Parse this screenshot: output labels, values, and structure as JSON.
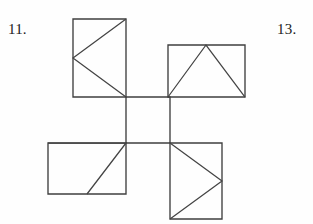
{
  "page": {
    "background_color": "#fefefe",
    "width": 313,
    "height": 224
  },
  "labels": [
    {
      "id": "label-11",
      "text": "11.",
      "x": 8,
      "y": 22
    },
    {
      "id": "label-13",
      "text": "13.",
      "x": 277,
      "y": 22
    }
  ],
  "figure": {
    "name": "cube-net-with-triangles",
    "stroke_color": "#3f3f3f",
    "stroke_width": 1.35,
    "fill": "none",
    "squares": [
      {
        "name": "top-left-square",
        "x1": 73,
        "y1": 19,
        "x2": 126,
        "y2": 97,
        "triangle_direction": "points-left",
        "triangle_points": "126,19 73,58 126,97"
      },
      {
        "name": "top-right-square",
        "x1": 168,
        "y1": 45,
        "x2": 245,
        "y2": 97,
        "triangle_direction": "points-up",
        "triangle_points": "168,97 206,45 245,97"
      },
      {
        "name": "center-square",
        "x1": 126,
        "y1": 97,
        "x2": 170,
        "y2": 143,
        "triangle_direction": "none",
        "triangle_points": ""
      },
      {
        "name": "bottom-left-square",
        "x1": 48,
        "y1": 143,
        "x2": 126,
        "y2": 194,
        "triangle_direction": "points-down",
        "triangle_points": "48,143 126,143 87,194"
      },
      {
        "name": "bottom-right-square",
        "x1": 170,
        "y1": 143,
        "x2": 222,
        "y2": 219,
        "triangle_direction": "points-right",
        "triangle_points": "170,143 222,181 170,219"
      }
    ]
  },
  "chart_data": {
    "type": "diagram",
    "title": "",
    "subtitle": "",
    "shapes": [
      {
        "label": "top-left-square",
        "kind": "square",
        "left": 73,
        "top": 19,
        "right": 126,
        "bottom": 97,
        "width": 53,
        "height": 78,
        "inner": "triangle pointing left, apex at left-edge midpoint"
      },
      {
        "label": "top-right-square",
        "kind": "square",
        "left": 168,
        "top": 45,
        "right": 245,
        "bottom": 97,
        "width": 77,
        "height": 52,
        "inner": "triangle pointing up, apex at top-edge midpoint"
      },
      {
        "label": "center-square",
        "kind": "square",
        "left": 126,
        "top": 97,
        "right": 170,
        "bottom": 143,
        "width": 44,
        "height": 46,
        "inner": "empty"
      },
      {
        "label": "bottom-left-square",
        "kind": "square",
        "left": 48,
        "top": 143,
        "right": 126,
        "bottom": 194,
        "width": 78,
        "height": 51,
        "inner": "triangle pointing down, apex at bottom-edge midpoint"
      },
      {
        "label": "bottom-right-square",
        "kind": "square",
        "left": 170,
        "top": 143,
        "right": 222,
        "bottom": 219,
        "width": 52,
        "height": 76,
        "inner": "triangle pointing right, apex at right-edge midpoint"
      }
    ],
    "annotations": [
      "11.",
      "13."
    ],
    "xlabel": "",
    "ylabel": ""
  }
}
